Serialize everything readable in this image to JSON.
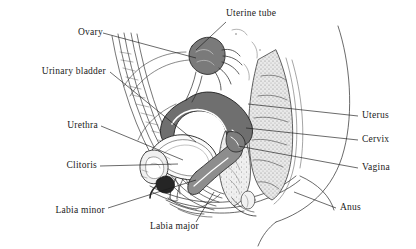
{
  "figure": {
    "type": "anatomical-line-drawing",
    "background_color": "#ffffff",
    "ink_color": "#1a1a1a",
    "width": 416,
    "height": 249
  },
  "labels": [
    {
      "id": "uterine-tube",
      "text": "Uterine tube",
      "side": "top",
      "x": 228,
      "y": 9,
      "leader": {
        "from": [
          226,
          22
        ],
        "to": [
          196,
          50
        ]
      }
    },
    {
      "id": "ovary",
      "text": "Ovary",
      "side": "left",
      "x": 64,
      "y": 27,
      "leader": {
        "from": [
          103,
          33
        ],
        "to": [
          196,
          58
        ]
      }
    },
    {
      "id": "urinary-bladder",
      "text": "Urinary bladder",
      "side": "left",
      "x": 18,
      "y": 66,
      "leader": {
        "from": [
          110,
          72
        ],
        "to": [
          196,
          142
        ]
      }
    },
    {
      "id": "urethra",
      "text": "Urethra",
      "side": "left",
      "x": 58,
      "y": 120,
      "leader": {
        "from": [
          101,
          126
        ],
        "to": [
          183,
          160
        ]
      }
    },
    {
      "id": "clitoris",
      "text": "Clitoris",
      "side": "left",
      "x": 58,
      "y": 160,
      "leader": {
        "from": [
          100,
          166
        ],
        "to": [
          178,
          164
        ]
      }
    },
    {
      "id": "labia-minor",
      "text": "Labia minor",
      "side": "left",
      "x": 38,
      "y": 206,
      "leader": {
        "from": [
          108,
          208
        ],
        "to": [
          196,
          180
        ]
      }
    },
    {
      "id": "labia-major",
      "text": "Labia major",
      "side": "bottom",
      "x": 152,
      "y": 222,
      "leader": {
        "from": [
          196,
          222
        ],
        "to": [
          214,
          192
        ]
      }
    },
    {
      "id": "uterus",
      "text": "Uterus",
      "side": "right",
      "x": 362,
      "y": 110,
      "leader": {
        "from": [
          358,
          116
        ],
        "to": [
          248,
          104
        ]
      }
    },
    {
      "id": "cervix",
      "text": "Cervix",
      "side": "right",
      "x": 362,
      "y": 134,
      "leader": {
        "from": [
          358,
          140
        ],
        "to": [
          246,
          128
        ]
      }
    },
    {
      "id": "vagina",
      "text": "Vagina",
      "side": "right",
      "x": 362,
      "y": 162,
      "leader": {
        "from": [
          358,
          168
        ],
        "to": [
          238,
          146
        ]
      }
    },
    {
      "id": "anus",
      "text": "Anus",
      "side": "right",
      "x": 340,
      "y": 202,
      "leader": {
        "from": [
          336,
          208
        ],
        "to": [
          294,
          192
        ]
      }
    }
  ],
  "structures": [
    {
      "id": "uterus-body",
      "name": "Uterus",
      "fill": "#6f6f6f"
    },
    {
      "id": "ovary-body",
      "name": "Ovary",
      "fill": "#7a7a7a"
    },
    {
      "id": "vaginal-canal",
      "name": "Vagina",
      "fill": "#8d8d8d"
    },
    {
      "id": "bladder-lumen",
      "name": "Urinary bladder",
      "fill": "#ffffff"
    },
    {
      "id": "clitoris-body",
      "name": "Clitoris",
      "fill": "#2b2b2b"
    },
    {
      "id": "sacrum-coccyx",
      "name": "Sacrum / coccyx",
      "fill": "#d8d8d8"
    },
    {
      "id": "rectum-canal",
      "name": "Rectum",
      "fill": "#e4e4e4"
    },
    {
      "id": "pubic-symphysis",
      "name": "Pubic symphysis",
      "fill": "#ececec"
    }
  ]
}
